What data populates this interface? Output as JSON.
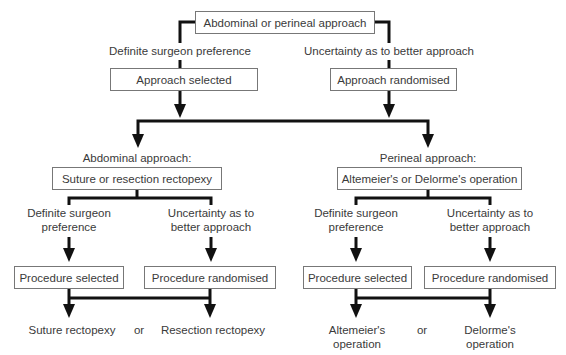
{
  "root": {
    "label": "Abdominal or perineal approach"
  },
  "top_branches": {
    "left_condition": "Definite surgeon preference",
    "right_condition": "Uncertainty as to better approach",
    "left_box": "Approach selected",
    "right_box": "Approach randomised"
  },
  "abdominal": {
    "heading": "Abdominal approach:",
    "box": "Suture or resection rectopexy",
    "left_condition_line1": "Definite surgeon",
    "left_condition_line2": "preference",
    "right_condition_line1": "Uncertainty as to",
    "right_condition_line2": "better approach",
    "left_box": "Procedure selected",
    "right_box": "Procedure randomised",
    "outcome_left": "Suture rectopexy",
    "or": "or",
    "outcome_right": "Resection rectopexy"
  },
  "perineal": {
    "heading": "Perineal approach:",
    "box": "Altemeier's or Delorme's operation",
    "left_condition_line1": "Definite surgeon",
    "left_condition_line2": "preference",
    "right_condition_line1": "Uncertainty as to",
    "right_condition_line2": "better approach",
    "left_box": "Procedure selected",
    "right_box": "Procedure randomised",
    "outcome_left_line1": "Altemeier's",
    "outcome_left_line2": "operation",
    "or": "or",
    "outcome_right_line1": "Delorme's",
    "outcome_right_line2": "operation"
  }
}
